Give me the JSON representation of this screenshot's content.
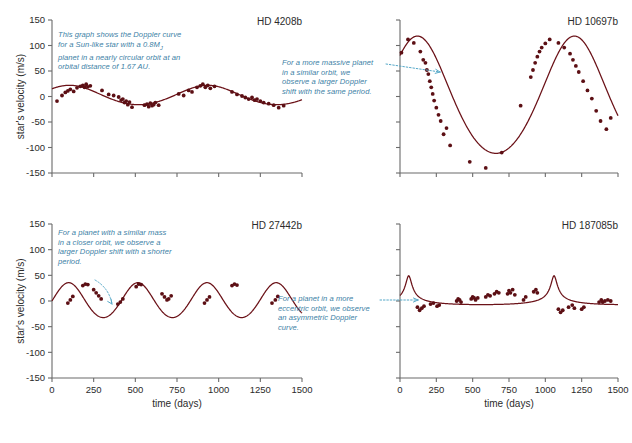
{
  "figure": {
    "background": "#ffffff",
    "curve_color": "#6b1218",
    "point_color": "#5c0f14",
    "axis_color": "#6b6b6b",
    "annotation_color": "#3d7fa6",
    "leader_color": "#55a8c8"
  },
  "axes": {
    "xlabel": "time (days)",
    "ylabel": "star's velocity (m/s)",
    "xticks": [
      0,
      250,
      500,
      750,
      1000,
      1250,
      1500
    ],
    "xticklabels": [
      "0",
      "250",
      "500",
      "750",
      "1000",
      "1250",
      "1500"
    ],
    "yticks": [
      -150,
      -100,
      -50,
      0,
      50,
      100,
      150
    ],
    "yticklabels": [
      "-150",
      "-100",
      "-50",
      "0",
      "50",
      "100",
      "150"
    ],
    "xlim": [
      0,
      1500
    ],
    "ylim": [
      -150,
      150
    ]
  },
  "chart_data": [
    {
      "id": "hd4208b",
      "type": "line",
      "title": "HD 4208b",
      "xlabel": "time (days)",
      "ylabel": "star's velocity (m/s)",
      "xlim": [
        0,
        1500
      ],
      "ylim": [
        -150,
        150
      ],
      "grid": false,
      "show_y_labels": true,
      "show_x_labels": false,
      "fit": {
        "model": "sinusoid",
        "amplitude": 19,
        "period": 829,
        "phase_days": 105,
        "offset": 2,
        "eccentricity": 0.05
      },
      "annotation": {
        "text": "This graph shows the Doppler curve for a Sun-like star with a 0.8Mⱼ planet in a nearly circular orbit at an orbital distance of 1.67 AU.",
        "lines": [
          "This graph shows the Doppler curve",
          "for a Sun-like star with a 0.8M",
          "planet in a nearly circular orbit at an",
          "orbital distance of 1.67 AU."
        ],
        "mass_subscript": "J",
        "has_leader": false
      },
      "points": [
        [
          30,
          -9
        ],
        [
          60,
          2
        ],
        [
          80,
          8
        ],
        [
          95,
          11
        ],
        [
          110,
          14
        ],
        [
          130,
          10
        ],
        [
          150,
          17
        ],
        [
          170,
          20
        ],
        [
          185,
          22
        ],
        [
          195,
          18
        ],
        [
          205,
          24
        ],
        [
          215,
          19
        ],
        [
          230,
          21
        ],
        [
          300,
          12
        ],
        [
          340,
          4
        ],
        [
          370,
          2
        ],
        [
          400,
          -1
        ],
        [
          415,
          -7
        ],
        [
          425,
          -5
        ],
        [
          435,
          -12
        ],
        [
          445,
          -9
        ],
        [
          455,
          -16
        ],
        [
          465,
          -11
        ],
        [
          480,
          -21
        ],
        [
          555,
          -17
        ],
        [
          570,
          -15
        ],
        [
          580,
          -20
        ],
        [
          590,
          -13
        ],
        [
          600,
          -18
        ],
        [
          610,
          -16
        ],
        [
          620,
          -12
        ],
        [
          640,
          -17
        ],
        [
          760,
          5
        ],
        [
          790,
          2
        ],
        [
          820,
          12
        ],
        [
          840,
          9
        ],
        [
          870,
          18
        ],
        [
          890,
          21
        ],
        [
          905,
          24
        ],
        [
          920,
          18
        ],
        [
          935,
          22
        ],
        [
          950,
          16
        ],
        [
          975,
          20
        ],
        [
          1080,
          9
        ],
        [
          1110,
          4
        ],
        [
          1140,
          1
        ],
        [
          1160,
          -2
        ],
        [
          1180,
          -5
        ],
        [
          1200,
          -2
        ],
        [
          1215,
          -7
        ],
        [
          1230,
          -5
        ],
        [
          1250,
          -9
        ],
        [
          1270,
          -12
        ],
        [
          1300,
          -14
        ],
        [
          1330,
          -17
        ],
        [
          1360,
          -22
        ],
        [
          1390,
          -18
        ]
      ]
    },
    {
      "id": "hd10697b",
      "type": "line",
      "title": "HD 10697b",
      "xlabel": "time (days)",
      "ylabel": "star's velocity (m/s)",
      "xlim": [
        0,
        1500
      ],
      "ylim": [
        -150,
        150
      ],
      "grid": false,
      "show_y_labels": false,
      "show_x_labels": false,
      "fit": {
        "model": "sinusoid",
        "amplitude": 115,
        "period": 1080,
        "phase_days": 120,
        "offset": -8,
        "eccentricity": 0.1
      },
      "annotation": {
        "text": "For a more massive planet in a similar orbit, we observe a larger Doppler shift with the same period.",
        "lines": [
          "For a more massive planet",
          "in a similar orbit, we",
          "observe a larger Doppler",
          "shift with the same period."
        ],
        "has_leader": true
      },
      "points": [
        [
          10,
          86
        ],
        [
          55,
          112
        ],
        [
          95,
          105
        ],
        [
          140,
          88
        ],
        [
          160,
          72
        ],
        [
          175,
          66
        ],
        [
          185,
          52
        ],
        [
          195,
          44
        ],
        [
          205,
          30
        ],
        [
          215,
          18
        ],
        [
          225,
          5
        ],
        [
          235,
          -8
        ],
        [
          250,
          -22
        ],
        [
          265,
          -36
        ],
        [
          280,
          -48
        ],
        [
          300,
          -74
        ],
        [
          320,
          -62
        ],
        [
          345,
          -96
        ],
        [
          480,
          -128
        ],
        [
          590,
          -140
        ],
        [
          700,
          -110
        ],
        [
          830,
          -18
        ],
        [
          900,
          38
        ],
        [
          915,
          52
        ],
        [
          930,
          66
        ],
        [
          945,
          78
        ],
        [
          960,
          88
        ],
        [
          975,
          96
        ],
        [
          1000,
          104
        ],
        [
          1030,
          112
        ],
        [
          1090,
          105
        ],
        [
          1130,
          96
        ],
        [
          1170,
          84
        ],
        [
          1190,
          72
        ],
        [
          1210,
          60
        ],
        [
          1230,
          48
        ],
        [
          1260,
          30
        ],
        [
          1290,
          12
        ],
        [
          1320,
          -4
        ],
        [
          1350,
          -28
        ],
        [
          1380,
          -48
        ],
        [
          1420,
          -64
        ],
        [
          1450,
          -42
        ]
      ]
    },
    {
      "id": "hd27442b",
      "type": "line",
      "title": "HD 27442b",
      "xlabel": "time (days)",
      "ylabel": "star's velocity (m/s)",
      "xlim": [
        0,
        1500
      ],
      "ylim": [
        -150,
        150
      ],
      "grid": false,
      "show_y_labels": true,
      "show_x_labels": true,
      "fit": {
        "model": "sinusoid",
        "amplitude": 34,
        "period": 415,
        "phase_days": 100,
        "offset": 0,
        "eccentricity": 0.05
      },
      "annotation": {
        "text": "For a planet with a similar mass in a closer orbit, we observe a larger Doppler shift with a shorter period.",
        "lines": [
          "For a planet with a similar mass",
          "in a closer orbit, we observe a",
          "larger Doppler shift with a shorter",
          "period."
        ],
        "has_leader": true
      },
      "points": [
        [
          95,
          -4
        ],
        [
          110,
          2
        ],
        [
          125,
          9
        ],
        [
          185,
          30
        ],
        [
          200,
          33
        ],
        [
          215,
          32
        ],
        [
          250,
          22
        ],
        [
          265,
          16
        ],
        [
          280,
          10
        ],
        [
          295,
          4
        ],
        [
          395,
          -6
        ],
        [
          410,
          -2
        ],
        [
          425,
          4
        ],
        [
          505,
          28
        ],
        [
          520,
          33
        ],
        [
          535,
          32
        ],
        [
          660,
          14
        ],
        [
          675,
          8
        ],
        [
          690,
          2
        ],
        [
          700,
          4
        ],
        [
          715,
          10
        ],
        [
          915,
          -4
        ],
        [
          930,
          2
        ],
        [
          945,
          8
        ],
        [
          1080,
          30
        ],
        [
          1095,
          33
        ],
        [
          1110,
          31
        ],
        [
          1320,
          -4
        ],
        [
          1340,
          2
        ],
        [
          1355,
          9
        ]
      ]
    },
    {
      "id": "hd187085b",
      "type": "line",
      "title": "HD 187085b",
      "xlabel": "time (days)",
      "ylabel": "star's velocity (m/s)",
      "xlim": [
        0,
        1500
      ],
      "ylim": [
        -150,
        150
      ],
      "grid": false,
      "show_y_labels": false,
      "show_x_labels": true,
      "fit": {
        "model": "eccentric",
        "amplitude": 28,
        "period": 1000,
        "phase_days": 60,
        "offset": 0,
        "eccentricity": 0.75
      },
      "annotation": {
        "text": "For a planet in a more eccentric orbit, we observe an asymmetric Doppler curve.",
        "lines": [
          "For a planet in a more",
          "eccentric orbit, we observe",
          "an asymmetric Doppler",
          "curve."
        ],
        "has_leader": true
      },
      "points": [
        [
          120,
          -12
        ],
        [
          135,
          -18
        ],
        [
          150,
          -14
        ],
        [
          165,
          -10
        ],
        [
          210,
          -6
        ],
        [
          230,
          -4
        ],
        [
          255,
          -10
        ],
        [
          270,
          -8
        ],
        [
          390,
          0
        ],
        [
          400,
          4
        ],
        [
          410,
          2
        ],
        [
          420,
          -2
        ],
        [
          490,
          4
        ],
        [
          500,
          8
        ],
        [
          510,
          6
        ],
        [
          520,
          2
        ],
        [
          535,
          6
        ],
        [
          590,
          8
        ],
        [
          605,
          12
        ],
        [
          620,
          10
        ],
        [
          650,
          14
        ],
        [
          665,
          18
        ],
        [
          680,
          16
        ],
        [
          740,
          14
        ],
        [
          750,
          20
        ],
        [
          760,
          16
        ],
        [
          775,
          22
        ],
        [
          790,
          12
        ],
        [
          850,
          2
        ],
        [
          865,
          8
        ],
        [
          920,
          18
        ],
        [
          935,
          22
        ],
        [
          945,
          16
        ],
        [
          1090,
          -16
        ],
        [
          1105,
          -22
        ],
        [
          1120,
          -18
        ],
        [
          1160,
          -12
        ],
        [
          1185,
          -8
        ],
        [
          1200,
          -14
        ],
        [
          1250,
          -16
        ],
        [
          1265,
          -12
        ],
        [
          1370,
          -2
        ],
        [
          1385,
          2
        ],
        [
          1395,
          -2
        ],
        [
          1410,
          0
        ],
        [
          1430,
          2
        ],
        [
          1450,
          0
        ]
      ]
    }
  ]
}
